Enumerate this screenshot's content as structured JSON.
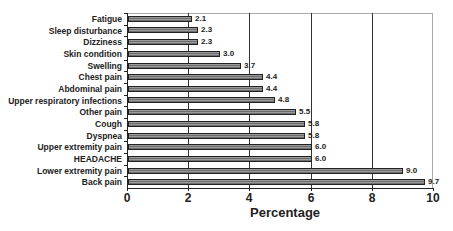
{
  "chart_data": {
    "type": "bar",
    "orientation": "horizontal",
    "title": "",
    "xlabel": "Percentage",
    "ylabel": "",
    "xlim": [
      0,
      10
    ],
    "xticks": [
      "0",
      "2",
      "4",
      "6",
      "8",
      "10"
    ],
    "grid": {
      "vertical": true,
      "horizontal": false
    },
    "legend": null,
    "categories": [
      "Fatigue",
      "Sleep disturbance",
      "Dizziness",
      "Skin condition",
      "Swelling",
      "Chest pain",
      "Abdominal pain",
      "Upper respiratory infections",
      "Other pain",
      "Cough",
      "Dyspnea",
      "Upper extremity pain",
      "HEADACHE",
      "Lower extremity pain",
      "Back pain"
    ],
    "values": [
      2.1,
      2.3,
      2.3,
      3.0,
      3.7,
      4.4,
      4.4,
      4.8,
      5.5,
      5.8,
      5.8,
      6.0,
      6.0,
      9.0,
      9.7
    ],
    "value_labels": [
      "2.1",
      "2.3",
      "2.3",
      "3.0",
      "3.7",
      "4.4",
      "4.4",
      "4.8",
      "5.5",
      "5.8",
      "5.8",
      "6.0",
      "6.0",
      "9.0",
      "9.7"
    ],
    "colors": {
      "bar_fill": "#808080",
      "bar_border": "#222222",
      "gridline": "#333333",
      "frame": "#aaaaaa"
    }
  }
}
